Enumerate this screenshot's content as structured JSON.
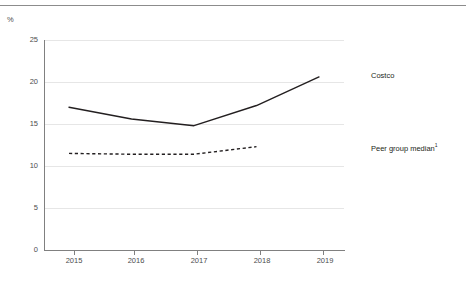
{
  "figure": {
    "title": "Return on invested capital",
    "unit_label": "%"
  },
  "legend": {
    "costco": "Costco",
    "peer": "Peer group median",
    "peer_footnote": "1"
  },
  "axis": {
    "y_ticks": [
      "0",
      "5",
      "10",
      "15",
      "20",
      "25"
    ],
    "x_ticks": [
      "2015",
      "2016",
      "2017",
      "2018",
      "2019"
    ]
  },
  "chart_data": {
    "type": "line",
    "title": "Return on invested capital",
    "xlabel": "",
    "ylabel": "%",
    "x": [
      2015,
      2016,
      2017,
      2018,
      2019
    ],
    "xlim": [
      2014.6,
      2019.4
    ],
    "ylim": [
      0,
      25
    ],
    "yticks": [
      0,
      5,
      10,
      15,
      20,
      25
    ],
    "grid": true,
    "legend_position": "right",
    "series": [
      {
        "name": "Costco",
        "style": "solid",
        "color": "#231f20",
        "x": [
          2015,
          2016,
          2017,
          2018,
          2019
        ],
        "values": [
          17.0,
          15.6,
          14.8,
          17.2,
          20.6
        ]
      },
      {
        "name": "Peer group median",
        "style": "dashed",
        "color": "#231f20",
        "x": [
          2015,
          2016,
          2017,
          2018
        ],
        "values": [
          11.5,
          11.4,
          11.4,
          12.3
        ]
      }
    ]
  }
}
